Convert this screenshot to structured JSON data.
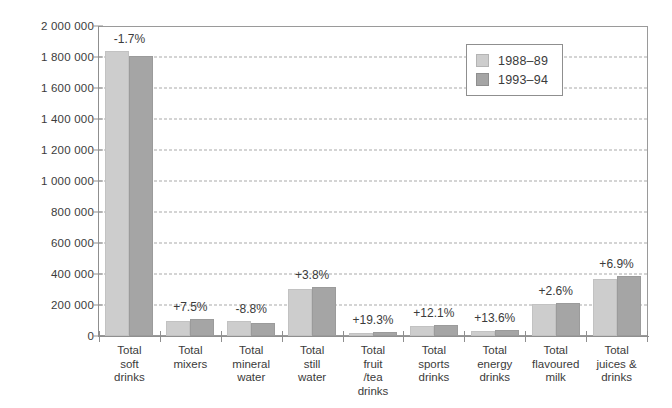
{
  "chart_data": {
    "type": "bar",
    "title": "",
    "subtitle": "",
    "xlabel": "",
    "ylabel": "",
    "ylim": [
      0,
      2000000
    ],
    "ytick_values": [
      0,
      200000,
      400000,
      600000,
      800000,
      1000000,
      1200000,
      1400000,
      1600000,
      1800000,
      2000000
    ],
    "ytick_labels": [
      "0",
      "200 000",
      "400 000",
      "600 000",
      "800 000",
      "1 000 000",
      "1 200 000",
      "1 400 000",
      "1 600 000",
      "1 800 000",
      "2 000 000"
    ],
    "grid": true,
    "grid_style": "dashed-horizontal",
    "legend_position": "top-right",
    "categories": [
      "Total\nsoft\ndrinks",
      "Total\nmixers",
      "Total\nmineral\nwater",
      "Total\nstill\nwater",
      "Total\nfruit\n/tea\ndrinks",
      "Total\nsports\ndrinks",
      "Total\nenergy\ndrinks",
      "Total\nflavoured\nmilk",
      "Total\njuices &\ndrinks"
    ],
    "series": [
      {
        "name": "1988–89",
        "color": "#cdcdcd",
        "values": [
          1840000,
          100000,
          95000,
          305000,
          20000,
          62000,
          33000,
          205000,
          365000
        ]
      },
      {
        "name": "1993–94",
        "color": "#a5a5a5",
        "values": [
          1808000,
          107500,
          87000,
          317000,
          24000,
          70000,
          38000,
          210000,
          390000
        ]
      }
    ],
    "annotations": [
      "-1.7%",
      "+7.5%",
      "-8.8%",
      "+3.8%",
      "+19.3%",
      "+12.1%",
      "+13.6%",
      "+2.6%",
      "+6.9%"
    ]
  },
  "legend": {
    "entries": [
      {
        "label": "1988–89"
      },
      {
        "label": "1993–94"
      }
    ]
  },
  "colors": {
    "series_1988": "#cdcdcd",
    "series_1993": "#a5a5a5",
    "axis": "#8f8f8f",
    "grid": "#a9a9a9",
    "text": "#3b3b3b",
    "background": "#ffffff"
  }
}
